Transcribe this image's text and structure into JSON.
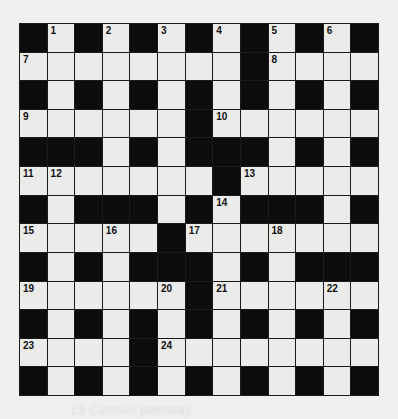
{
  "puzzle": {
    "rows": 13,
    "cols": 13,
    "layout": [
      "#.#.#.#.#.#.#",
      "........#....",
      "#.#.#.#.#.#.#",
      "......#......",
      "###.#.###.#.#",
      ".......#.....",
      "#.###.#.###.#",
      ".....#.......",
      "#.#.###.#.###",
      "......#......",
      "#.#.#.#.#.#.#",
      "....#........",
      "#.#.#.#.#.#.#"
    ],
    "numbers": [
      {
        "row": 0,
        "col": 1,
        "n": "1"
      },
      {
        "row": 0,
        "col": 3,
        "n": "2"
      },
      {
        "row": 0,
        "col": 5,
        "n": "3"
      },
      {
        "row": 0,
        "col": 7,
        "n": "4"
      },
      {
        "row": 0,
        "col": 9,
        "n": "5"
      },
      {
        "row": 0,
        "col": 11,
        "n": "6"
      },
      {
        "row": 1,
        "col": 0,
        "n": "7"
      },
      {
        "row": 1,
        "col": 9,
        "n": "8"
      },
      {
        "row": 3,
        "col": 0,
        "n": "9"
      },
      {
        "row": 3,
        "col": 7,
        "n": "10"
      },
      {
        "row": 5,
        "col": 0,
        "n": "11"
      },
      {
        "row": 5,
        "col": 1,
        "n": "12"
      },
      {
        "row": 5,
        "col": 8,
        "n": "13"
      },
      {
        "row": 6,
        "col": 7,
        "n": "14"
      },
      {
        "row": 7,
        "col": 0,
        "n": "15"
      },
      {
        "row": 7,
        "col": 3,
        "n": "16"
      },
      {
        "row": 7,
        "col": 6,
        "n": "17"
      },
      {
        "row": 7,
        "col": 9,
        "n": "18"
      },
      {
        "row": 9,
        "col": 0,
        "n": "19"
      },
      {
        "row": 9,
        "col": 5,
        "n": "20"
      },
      {
        "row": 9,
        "col": 7,
        "n": "21"
      },
      {
        "row": 9,
        "col": 11,
        "n": "22"
      },
      {
        "row": 11,
        "col": 0,
        "n": "23"
      },
      {
        "row": 11,
        "col": 5,
        "n": "24"
      }
    ]
  },
  "bleed_text": "19 Cosmic pathway",
  "colors": {
    "background": "#efefed",
    "white_cell": "#ebebea",
    "black_cell": "#0c0c0c",
    "grid_line": "#1a1a1a"
  }
}
